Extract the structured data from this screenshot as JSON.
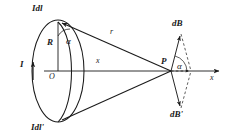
{
  "figure": {
    "background_color": "#ffffff",
    "ink_color": "#1a1a1a",
    "width": 230,
    "height": 138
  },
  "labels": {
    "current_element_top": "Idl",
    "current_element_bottom": "Idl'",
    "current": "I",
    "radius": "R",
    "center": "O",
    "axial_distance": "x",
    "source_distance": "r",
    "angle_at_loop": "α",
    "angle_at_point": "α",
    "field_point": "P",
    "field_vector_top": "dB",
    "field_vector_bottom": "dB'",
    "axis": "x"
  },
  "elements": {
    "loop": {
      "name": "current-loop",
      "shape": "ellipse",
      "center": [
        99,
        71
      ],
      "rx": 26,
      "ry": 53,
      "stroke": "#1a1a1a"
    },
    "axis_line": {
      "name": "x-axis",
      "from": [
        46,
        71
      ],
      "to": [
        222,
        71
      ],
      "arrow": true
    },
    "radius_segment": {
      "from": [
        58,
        71
      ],
      "to": [
        58,
        22
      ]
    },
    "r_segment": {
      "from": [
        58,
        22
      ],
      "to": [
        171,
        71
      ]
    },
    "lower_segment": {
      "from": [
        58,
        122
      ],
      "to": [
        171,
        71
      ]
    },
    "current_arrow": {
      "at": [
        22,
        62
      ],
      "direction": "up"
    },
    "dB_vector": {
      "from": [
        171,
        71
      ],
      "to": [
        179,
        33
      ],
      "style": "solid"
    },
    "dB_prime_vector": {
      "from": [
        171,
        71
      ],
      "to": [
        179,
        109
      ],
      "style": "solid"
    },
    "dB_parallelogram_dashes": [
      {
        "from": [
          179,
          33
        ],
        "to": [
          189,
          71
        ]
      },
      {
        "from": [
          179,
          109
        ],
        "to": [
          189,
          71
        ]
      }
    ],
    "resultant_axis_tick": {
      "from": [
        171,
        71
      ],
      "to": [
        189,
        71
      ],
      "style": "dashed"
    },
    "angle_arc_loop": {
      "center": [
        58,
        22
      ],
      "radius": 14
    },
    "angle_arc_point": {
      "center": [
        171,
        71
      ],
      "radius": 17
    }
  }
}
